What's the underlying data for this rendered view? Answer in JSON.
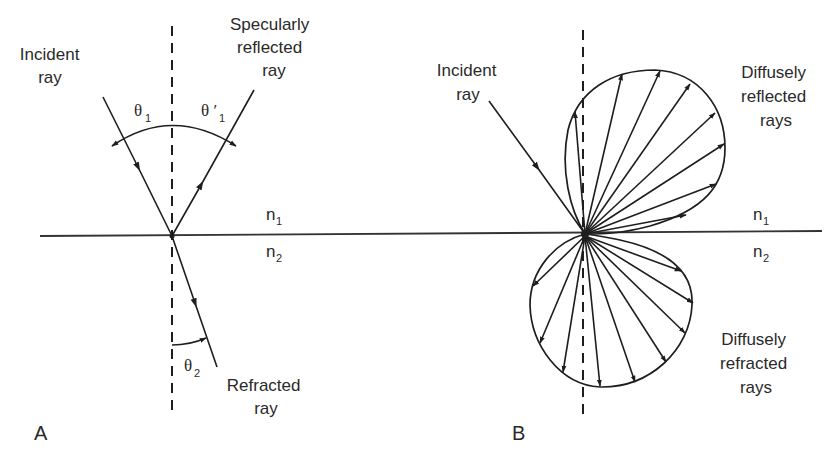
{
  "figure": {
    "panels": {
      "A": {
        "label": "A",
        "incident_label_line1": "Incident",
        "incident_label_line2": "ray",
        "reflected_label_line1": "Specularly",
        "reflected_label_line2": "reflected",
        "reflected_label_line3": "ray",
        "refracted_label_line1": "Refracted",
        "refracted_label_line2": "ray",
        "theta1": "θ",
        "theta1_sub": "1",
        "theta1_prime": "θ ′",
        "theta1_prime_sub": "1",
        "theta2": "θ",
        "theta2_sub": "2",
        "n1": "n",
        "n1_sub": "1",
        "n2": "n",
        "n2_sub": "2"
      },
      "B": {
        "label": "B",
        "incident_label_line1": "Incident",
        "incident_label_line2": "ray",
        "reflected_label_line1": "Diffusely",
        "reflected_label_line2": "reflected",
        "reflected_label_line3": "rays",
        "refracted_label_line1": "Diffusely",
        "refracted_label_line2": "refracted",
        "refracted_label_line3": "rays",
        "n1": "n",
        "n1_sub": "1",
        "n2": "n",
        "n2_sub": "2"
      }
    },
    "colors": {
      "ink": "#1e1e1e",
      "background": "#ffffff"
    }
  }
}
